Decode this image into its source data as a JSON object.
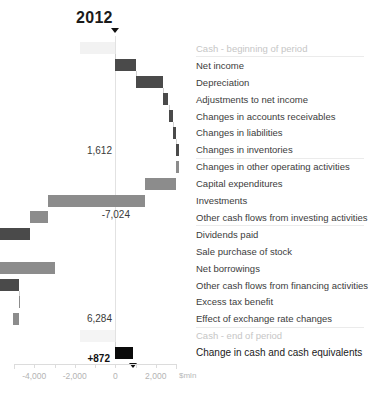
{
  "title": "2012",
  "axis": {
    "unit": "$mln",
    "ticks": [
      {
        "value": -4000,
        "label": "-4,000"
      },
      {
        "value": -2000,
        "label": "-2,000"
      },
      {
        "value": 0,
        "label": "0"
      },
      {
        "value": 2000,
        "label": "2,000"
      }
    ],
    "min": -5000,
    "max": 3000,
    "minor_step": 1000
  },
  "value_labels": [
    {
      "text": "1,612",
      "bold": false
    },
    {
      "text": "-7,024",
      "bold": false
    },
    {
      "text": "6,284",
      "bold": false
    },
    {
      "text": "+872",
      "bold": true
    }
  ],
  "rows": [
    {
      "label": "Cash - beginning of period",
      "style": "muted"
    },
    {
      "label": "Net income",
      "style": "normal"
    },
    {
      "label": "Depreciation",
      "style": "normal"
    },
    {
      "label": "Adjustments to net income",
      "style": "normal"
    },
    {
      "label": "Changes in accounts receivables",
      "style": "normal"
    },
    {
      "label": "Changes in liabilities",
      "style": "normal"
    },
    {
      "label": "Changes in inventories",
      "style": "normal"
    },
    {
      "label": "Changes in other operating activities",
      "style": "normal"
    },
    {
      "label": "Capital expenditures",
      "style": "normal"
    },
    {
      "label": "Investments",
      "style": "normal"
    },
    {
      "label": "Other cash flows from investing activities",
      "style": "normal"
    },
    {
      "label": "Dividends paid",
      "style": "normal"
    },
    {
      "label": "Sale purchase of stock",
      "style": "normal"
    },
    {
      "label": "Net borrowings",
      "style": "normal"
    },
    {
      "label": "Other cash flows from financing activities",
      "style": "normal"
    },
    {
      "label": "Excess tax benefit",
      "style": "normal"
    },
    {
      "label": "Effect of exchange rate changes",
      "style": "normal"
    },
    {
      "label": "Cash - end of period",
      "style": "muted"
    },
    {
      "label": "Change in cash and cash equivalents",
      "style": "strong"
    }
  ],
  "chart_data": {
    "type": "bar",
    "chart_variant": "waterfall-horizontal",
    "title": "2012",
    "xlabel": "$mln",
    "ylabel": "",
    "xlim": [
      -5000,
      3000
    ],
    "grid": false,
    "legend": false,
    "categories": [
      "Cash - beginning of period",
      "Net income",
      "Depreciation",
      "Adjustments to net income",
      "Changes in accounts receivables",
      "Changes in liabilities",
      "Changes in inventories",
      "Changes in other operating activities",
      "Capital expenditures",
      "Investments",
      "Other cash flows from investing activities",
      "Dividends paid",
      "Sale purchase of stock",
      "Net borrowings",
      "Other cash flows from financing activities",
      "Excess tax benefit",
      "Effect of exchange rate changes",
      "Cash - end of period",
      "Change in cash and cash equivalents"
    ],
    "values": [
      1612,
      1000,
      1350,
      280,
      210,
      170,
      130,
      -160,
      -1500,
      -4800,
      -900,
      -7024,
      1250,
      2800,
      -2800,
      1000,
      -260,
      6284,
      872
    ],
    "cumulative_start": [
      0,
      0,
      1000,
      2350,
      2630,
      2840,
      3010,
      3140,
      2980,
      1480,
      -3320,
      -4220,
      -7024,
      -5774,
      -2974,
      -5774,
      -4774,
      0,
      0
    ],
    "cumulative_end": [
      1612,
      1000,
      2350,
      2630,
      2840,
      3010,
      3140,
      2980,
      1480,
      -3320,
      -4220,
      -7024,
      -5774,
      -2974,
      -5774,
      -4774,
      -5034,
      6284,
      872
    ],
    "bars": [
      {
        "category": "Cash - beginning of period",
        "x0": -1750,
        "x1": 0,
        "color": "#f2f2f2",
        "kind": "total"
      },
      {
        "category": "Net income",
        "x0": 0,
        "x1": 1000,
        "color": "#4a4a4a",
        "kind": "delta"
      },
      {
        "category": "Depreciation",
        "x0": 1000,
        "x1": 2350,
        "color": "#4a4a4a",
        "kind": "delta"
      },
      {
        "category": "Adjustments to net income",
        "x0": 2350,
        "x1": 2630,
        "color": "#4a4a4a",
        "kind": "delta"
      },
      {
        "category": "Changes in accounts receivables",
        "x0": 2630,
        "x1": 2840,
        "color": "#4a4a4a",
        "kind": "delta"
      },
      {
        "category": "Changes in liabilities",
        "x0": 2840,
        "x1": 3010,
        "color": "#4a4a4a",
        "kind": "delta"
      },
      {
        "category": "Changes in inventories",
        "x0": 3010,
        "x1": 3140,
        "color": "#4a4a4a",
        "kind": "delta"
      },
      {
        "category": "Changes in other operating activities",
        "x0": 2980,
        "x1": 3140,
        "color": "#8c8c8c",
        "kind": "delta"
      },
      {
        "category": "Capital expenditures",
        "x0": 1480,
        "x1": 2980,
        "color": "#8c8c8c",
        "kind": "delta"
      },
      {
        "category": "Investments",
        "x0": -3320,
        "x1": 1480,
        "color": "#8c8c8c",
        "kind": "delta"
      },
      {
        "category": "Other cash flows from investing activities",
        "x0": -4220,
        "x1": -3320,
        "color": "#8c8c8c",
        "kind": "delta"
      },
      {
        "category": "Dividends paid",
        "x0": -7024,
        "x1": -4220,
        "color": "#4a4a4a",
        "kind": "delta"
      },
      {
        "category": "Sale purchase of stock",
        "x0": -7024,
        "x1": -5774,
        "color": "#4a4a4a",
        "kind": "delta"
      },
      {
        "category": "Net borrowings",
        "x0": -5774,
        "x1": -2974,
        "color": "#8c8c8c",
        "kind": "delta"
      },
      {
        "category": "Other cash flows from financing activities",
        "x0": -5774,
        "x1": -4774,
        "color": "#4a4a4a",
        "kind": "delta"
      },
      {
        "category": "Excess tax benefit",
        "x0": -4774,
        "x1": -4774,
        "color": "#8c8c8c",
        "kind": "delta"
      },
      {
        "category": "Effect of exchange rate changes",
        "x0": -5034,
        "x1": -4774,
        "color": "#8c8c8c",
        "kind": "delta"
      },
      {
        "category": "Cash - end of period",
        "x0": -1750,
        "x1": 0,
        "color": "#f4f4f4",
        "kind": "total"
      },
      {
        "category": "Change in cash and cash equivalents",
        "x0": 0,
        "x1": 872,
        "color": "#0a0a0a",
        "kind": "total"
      }
    ],
    "annotations": [
      {
        "text": "1,612",
        "near": "Changes in other operating activities"
      },
      {
        "text": "-7,024",
        "near": "Other cash flows from investing activities"
      },
      {
        "text": "6,284",
        "near": "Effect of exchange rate changes"
      },
      {
        "text": "+872",
        "near": "Change in cash and cash equivalents"
      }
    ]
  }
}
